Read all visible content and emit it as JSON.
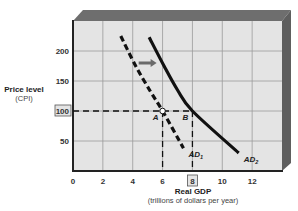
{
  "chart_data": {
    "type": "line",
    "title": "",
    "xlabel": "Real GDP",
    "xlabel_sub": "(trillions of dollars per year)",
    "ylabel": "Price level",
    "ylabel_sub": "(CPI)",
    "xlim": [
      0,
      14
    ],
    "ylim": [
      0,
      250
    ],
    "x_ticks": [
      0,
      2,
      4,
      6,
      8,
      10,
      12
    ],
    "x_tick_labels": [
      "0",
      "2",
      "4",
      "6",
      "8",
      "10",
      "12"
    ],
    "y_ticks": [
      50,
      100,
      150,
      200
    ],
    "y_tick_labels": [
      "50",
      "100",
      "150",
      "200"
    ],
    "highlighted_x_tick": "8",
    "highlighted_y_tick": "100",
    "grid": true,
    "series": [
      {
        "name": "AD1",
        "label_main": "AD",
        "label_sub": "1",
        "style": "dashed",
        "points": [
          [
            3.2,
            225
          ],
          [
            4.2,
            175
          ],
          [
            5.2,
            132
          ],
          [
            6.0,
            100
          ],
          [
            7.4,
            38
          ]
        ]
      },
      {
        "name": "AD2",
        "label_main": "AD",
        "label_sub": "2",
        "style": "solid",
        "points": [
          [
            5.1,
            223
          ],
          [
            6.1,
            175
          ],
          [
            7.0,
            135
          ],
          [
            8.0,
            100
          ],
          [
            11.1,
            30
          ]
        ]
      }
    ],
    "points": [
      {
        "label": "A",
        "x": 6,
        "y": 100,
        "marker": "open-circle"
      },
      {
        "label": "B",
        "x": 8,
        "y": 100,
        "marker": "none"
      }
    ],
    "reference_lines": [
      {
        "type": "horizontal",
        "y": 100,
        "from_x": 0,
        "to_x": 8,
        "style": "dashed"
      },
      {
        "type": "vertical",
        "x": 6,
        "from_y": 0,
        "to_y": 100,
        "style": "dashed"
      },
      {
        "type": "vertical",
        "x": 8,
        "from_y": 0,
        "to_y": 100,
        "style": "dashed"
      }
    ],
    "annotations": [
      {
        "type": "arrow",
        "from": [
          4.4,
          180
        ],
        "to": [
          5.6,
          180
        ],
        "meaning": "shift right from AD1 to AD2"
      }
    ],
    "colors": {
      "plot_bg": "#e4e4e4",
      "grid": "#9a9a9a",
      "frame": "#5a5a5a",
      "curve": "#111111",
      "arrow": "#6a6a6a"
    }
  }
}
